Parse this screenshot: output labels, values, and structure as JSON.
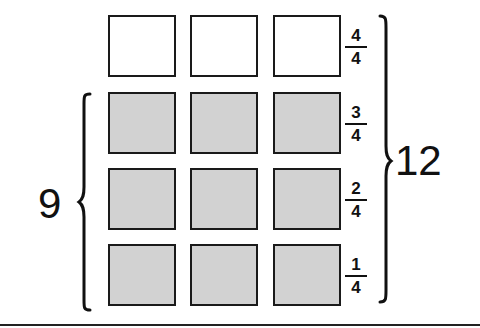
{
  "diagram": {
    "rows": [
      {
        "label_num": "4",
        "label_den": "4",
        "filled": false,
        "cells": 3
      },
      {
        "label_num": "3",
        "label_den": "4",
        "filled": true,
        "cells": 3
      },
      {
        "label_num": "2",
        "label_den": "4",
        "filled": true,
        "cells": 3
      },
      {
        "label_num": "1",
        "label_den": "4",
        "filled": true,
        "cells": 3
      }
    ],
    "left_brace_label": "9",
    "right_brace_label": "12",
    "colors": {
      "filled": "#d2d2d2",
      "empty": "#ffffff",
      "stroke": "#1a1a1a"
    }
  }
}
